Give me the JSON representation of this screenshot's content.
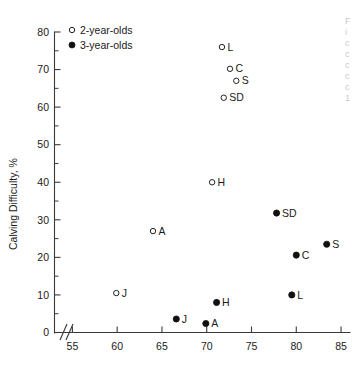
{
  "chart_data": {
    "type": "scatter",
    "title": "",
    "xlabel": "",
    "ylabel": "Calving Difficulty, %",
    "xlim": [
      53.0,
      86.0
    ],
    "ylim": [
      0,
      80
    ],
    "xticks": [
      55,
      60,
      65,
      70,
      75,
      80,
      85
    ],
    "yticks": [
      0,
      10,
      20,
      30,
      40,
      50,
      60,
      70,
      80
    ],
    "grid": false,
    "x_axis_break": true,
    "legend_position": "top-left-inside",
    "series": [
      {
        "name": "2-year-olds",
        "marker": "open-circle",
        "points": [
          {
            "label": "L",
            "x": 71.7,
            "y": 76.0
          },
          {
            "label": "C",
            "x": 72.6,
            "y": 70.2
          },
          {
            "label": "S",
            "x": 73.3,
            "y": 67.0
          },
          {
            "label": "SD",
            "x": 71.9,
            "y": 62.5
          },
          {
            "label": "H",
            "x": 70.6,
            "y": 40.0
          },
          {
            "label": "A",
            "x": 64.0,
            "y": 27.0
          },
          {
            "label": "J",
            "x": 59.9,
            "y": 10.5
          }
        ]
      },
      {
        "name": "3-year-olds",
        "marker": "filled-circle",
        "points": [
          {
            "label": "SD",
            "x": 77.8,
            "y": 31.8
          },
          {
            "label": "S",
            "x": 83.4,
            "y": 23.5
          },
          {
            "label": "C",
            "x": 80.0,
            "y": 20.6
          },
          {
            "label": "L",
            "x": 79.5,
            "y": 10.0
          },
          {
            "label": "H",
            "x": 71.1,
            "y": 8.0
          },
          {
            "label": "J",
            "x": 66.6,
            "y": 3.6
          },
          {
            "label": "A",
            "x": 69.9,
            "y": 2.4
          }
        ]
      }
    ]
  },
  "legend": {
    "entries": [
      {
        "label": "2-year-olds",
        "marker": "open-circle"
      },
      {
        "label": "3-year-olds",
        "marker": "filled-circle"
      }
    ]
  },
  "axes": {
    "y_title": "Calving Difficulty, %",
    "y_tick_labels": [
      "0",
      "10",
      "20",
      "30",
      "40",
      "50",
      "60",
      "70",
      "80"
    ],
    "x_tick_labels": [
      "55",
      "60",
      "65",
      "70",
      "75",
      "80",
      "85"
    ]
  },
  "colors": {
    "axis": "#3a3a3a",
    "text": "#1a1a1a",
    "marker_filled": "#111111",
    "marker_open_stroke": "#222222",
    "background": "#ffffff"
  }
}
